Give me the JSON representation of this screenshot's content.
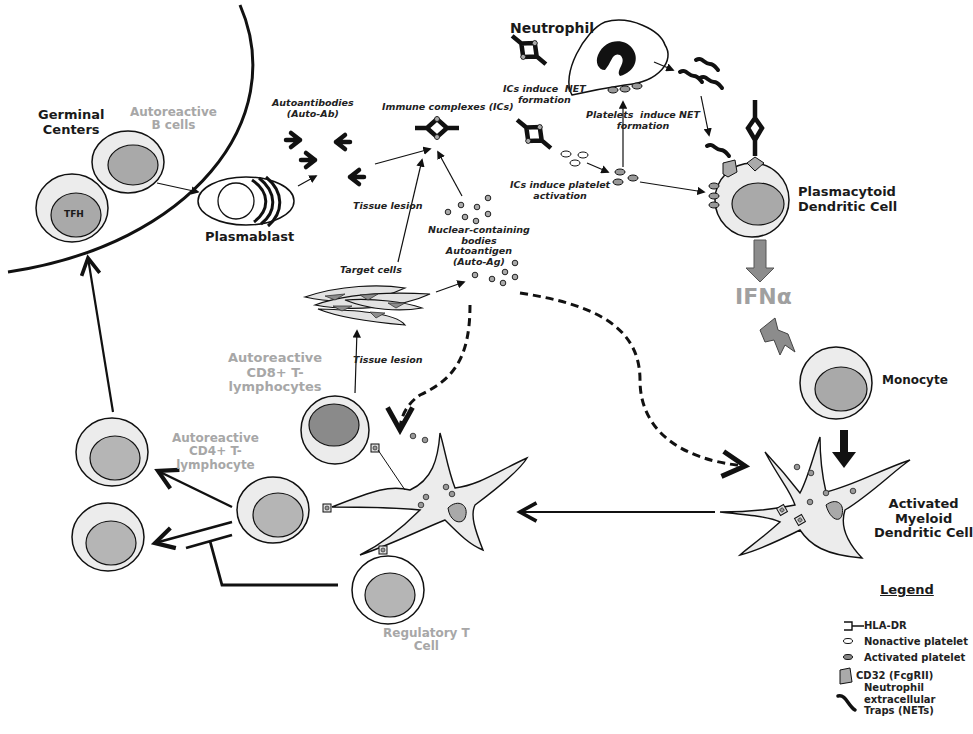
{
  "diagram": {
    "colors": {
      "line": "#111111",
      "cell_fill": "#ececec",
      "nucleus_fill": "#b9b9b9",
      "nucleus_dark": "#8a8a8a",
      "gray_label": "#a7a7a7",
      "ifn_arrow": "#8c8c8c"
    },
    "regions": {
      "germinal_centers": "Germinal\nCenters"
    },
    "cells": {
      "autoreactive_b": "Autoreactive\nB cells",
      "tfh": "TFH",
      "plasmablast": "Plasmablast",
      "neutrophil": "Neutrophil",
      "pdc": "Plasmacytoid\nDendritic Cell",
      "monocyte": "Monocyte",
      "activated_mdc": "Activated\nMyeloid\nDendritic Cell",
      "cd8": "Autoreactive\nCD8+ T-\nlymphocytes",
      "cd4": "Autoreactive\nCD4+ T-\nlymphocyte",
      "treg": "Regulatory T\nCell",
      "target_cells": "Target cells"
    },
    "molecules": {
      "autoantibodies": "Autoantibodies\n(Auto-Ab)",
      "immune_complexes": "Immune complexes (ICs)",
      "nuclear_bodies": "Nuclear-containing\nbodies\nAutoantigen\n(Auto-Ag)",
      "ifn": "IFNα"
    },
    "processes": {
      "ics_net": "ICs induce  NET\nformation",
      "platelets_net": "Platelets  induce NET\nformation",
      "ics_platelet": "ICs induce platelet\nactivation",
      "tissue_lesion_upper": "Tissue lesion",
      "tissue_lesion_lower": "Tissue lesion"
    },
    "legend": {
      "title": "Legend",
      "items": [
        {
          "icon": "hla-dr-icon",
          "label": "HLA-DR"
        },
        {
          "icon": "nonactive-platelet-icon",
          "label": "Nonactive platelet"
        },
        {
          "icon": "activated-platelet-icon",
          "label": "Activated platelet"
        },
        {
          "icon": "cd32-icon",
          "label": "CD32 (FcgRII)"
        },
        {
          "icon": "net-icon",
          "label": "Neutrophil\nextracellular\nTraps (NETs)"
        }
      ]
    }
  }
}
